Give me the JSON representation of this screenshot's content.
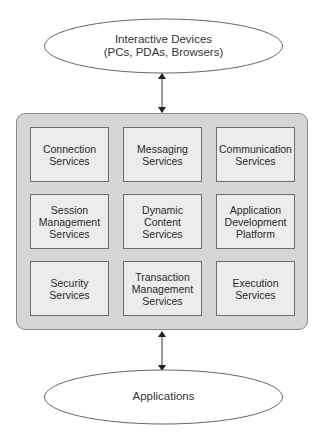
{
  "diagram": {
    "top_node": {
      "label_line1": "Interactive Devices",
      "label_line2": "(PCs, PDAs, Browsers)"
    },
    "bottom_node": {
      "label": "Applications"
    },
    "framework": {
      "services": [
        [
          "Connection\nServices",
          "Messaging\nServices",
          "Communication\nServices"
        ],
        [
          "Session\nManagement\nServices",
          "Dynamic\nContent\nServices",
          "Application\nDevelopment\nPlatform"
        ],
        [
          "Security\nServices",
          "Transaction\nManagement\nServices",
          "Execution\nServices"
        ]
      ]
    },
    "connectors": [
      {
        "from": "top_node",
        "to": "framework",
        "type": "bidirectional-arrow"
      },
      {
        "from": "framework",
        "to": "bottom_node",
        "type": "bidirectional-arrow"
      }
    ],
    "caption": ""
  },
  "colors": {
    "container_fill": "#d6d6d6",
    "service_fill": "#ececec",
    "service_border": "#6e6e6e",
    "line": "#333333"
  }
}
